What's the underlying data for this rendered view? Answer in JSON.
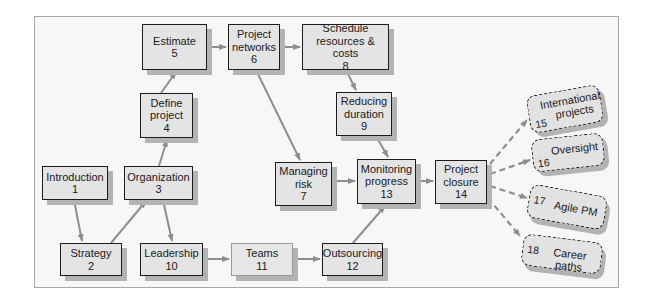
{
  "diagram": {
    "colors": {
      "frame_bg": "#f7f7f6",
      "node_fill": "#e4e4e4",
      "node_border": "#1c1c1c",
      "shadow": "#b3b3b3",
      "arrow": "#8e8e8e"
    },
    "nodes": [
      {
        "id": 1,
        "label": "Introduction",
        "label2": "",
        "number": "1"
      },
      {
        "id": 2,
        "label": "Strategy",
        "label2": "",
        "number": "2"
      },
      {
        "id": 3,
        "label": "Organization",
        "label2": "",
        "number": "3"
      },
      {
        "id": 4,
        "label": "Define",
        "label2": "project",
        "number": "4"
      },
      {
        "id": 5,
        "label": "Estimate",
        "label2": "",
        "number": "5"
      },
      {
        "id": 6,
        "label": "Project",
        "label2": "networks",
        "number": "6"
      },
      {
        "id": 7,
        "label": "Managing",
        "label2": "risk",
        "number": "7"
      },
      {
        "id": 8,
        "label": "Schedule",
        "label2": "resources & costs",
        "number": "8"
      },
      {
        "id": 9,
        "label": "Reducing",
        "label2": "duration",
        "number": "9"
      },
      {
        "id": 10,
        "label": "Leadership",
        "label2": "",
        "number": "10"
      },
      {
        "id": 11,
        "label": "Teams",
        "label2": "",
        "number": "11"
      },
      {
        "id": 12,
        "label": "Outsourcing",
        "label2": "",
        "number": "12"
      },
      {
        "id": 13,
        "label": "Monitoring",
        "label2": "progress",
        "number": "13"
      },
      {
        "id": 14,
        "label": "Project",
        "label2": "closure",
        "number": "14"
      }
    ],
    "extensions": [
      {
        "id": 15,
        "label": "International",
        "label2": "projects",
        "number": "15"
      },
      {
        "id": 16,
        "label": "Oversight",
        "number": "16"
      },
      {
        "id": 17,
        "label": "Agile PM",
        "number": "17"
      },
      {
        "id": 18,
        "label": "Career paths",
        "number": "18"
      }
    ],
    "edges": [
      {
        "from": 1,
        "to": 2
      },
      {
        "from": 2,
        "to": 3
      },
      {
        "from": 3,
        "to": 4
      },
      {
        "from": 3,
        "to": 10
      },
      {
        "from": 4,
        "to": 5
      },
      {
        "from": 5,
        "to": 6
      },
      {
        "from": 6,
        "to": 8
      },
      {
        "from": 6,
        "to": 7
      },
      {
        "from": 8,
        "to": 9
      },
      {
        "from": 9,
        "to": 13
      },
      {
        "from": 7,
        "to": 13
      },
      {
        "from": 10,
        "to": 11
      },
      {
        "from": 11,
        "to": 12
      },
      {
        "from": 12,
        "to": 13
      },
      {
        "from": 13,
        "to": 14
      },
      {
        "from": 14,
        "to": 15,
        "style": "dashed"
      },
      {
        "from": 14,
        "to": 16,
        "style": "dashed"
      },
      {
        "from": 14,
        "to": 17,
        "style": "dashed"
      },
      {
        "from": 14,
        "to": 18,
        "style": "dashed"
      }
    ]
  }
}
